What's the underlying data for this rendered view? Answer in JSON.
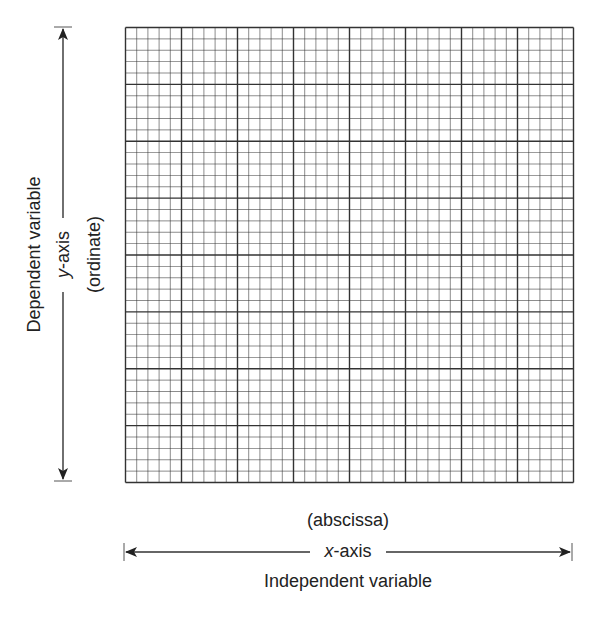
{
  "diagram": {
    "grid": {
      "major_divisions_x": 8,
      "major_divisions_y": 8,
      "minor_per_major": 5,
      "line_color": "#333333"
    },
    "y_axis": {
      "label_outer": "Dependent variable",
      "label_name_var": "y",
      "label_name_rest": "-axis",
      "label_inner": "(ordinate)"
    },
    "x_axis": {
      "label_top": "(abscissa)",
      "label_name_var": "x",
      "label_name_rest": "-axis",
      "label_bottom": "Independent variable"
    }
  }
}
